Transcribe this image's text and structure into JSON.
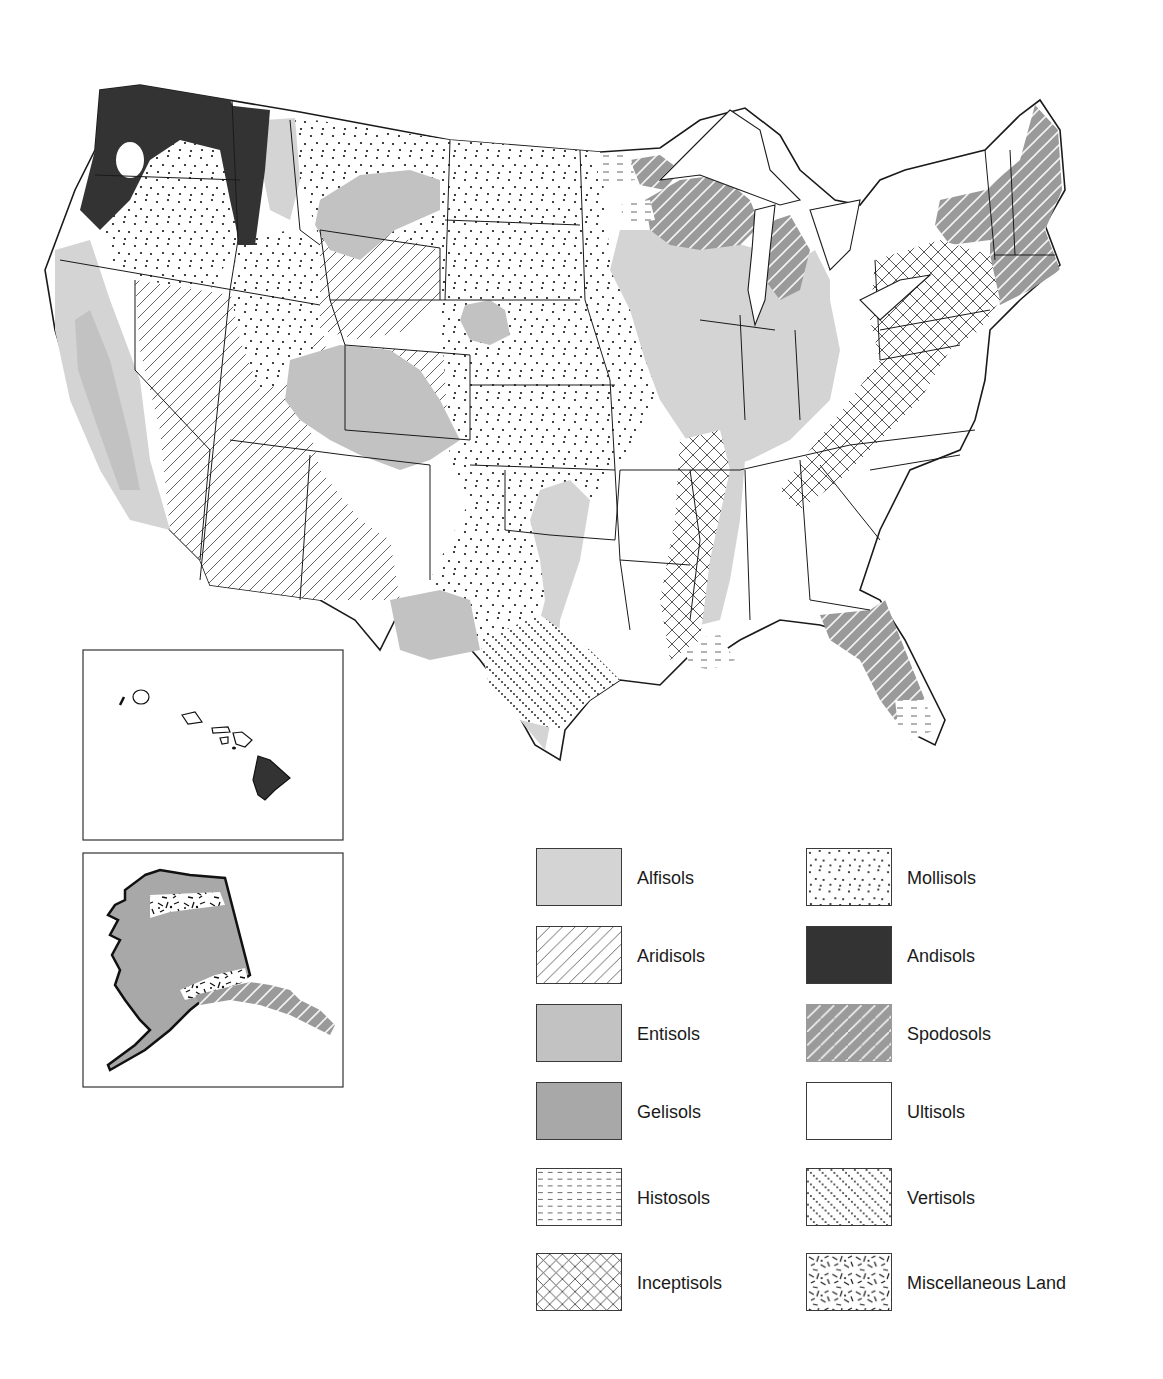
{
  "map": {
    "title": "",
    "regions": {
      "main": "Contiguous United States",
      "inset_1": "Hawaii",
      "inset_2": "Alaska"
    }
  },
  "colors": {
    "alfisols": "#d4d4d4",
    "entisols": "#c2c2c2",
    "gelisols": "#a8a8a8",
    "andisols": "#333333",
    "spodosols": "#9a9a9a",
    "ultisols": "#ffffff",
    "outline": "#1a1a1a"
  },
  "legend": {
    "left": [
      {
        "id": "alfisols",
        "label": "Alfisols",
        "pattern": "solid-light-gray"
      },
      {
        "id": "aridisols",
        "label": "Aridisols",
        "pattern": "diagonal-lines"
      },
      {
        "id": "entisols",
        "label": "Entisols",
        "pattern": "solid-medium-gray"
      },
      {
        "id": "gelisols",
        "label": "Gelisols",
        "pattern": "solid-dark-gray"
      },
      {
        "id": "histosols",
        "label": "Histosols",
        "pattern": "horizontal-dashes"
      },
      {
        "id": "inceptisols",
        "label": "Inceptisols",
        "pattern": "cross-hatch"
      }
    ],
    "right": [
      {
        "id": "mollisols",
        "label": "Mollisols",
        "pattern": "stipple-dots"
      },
      {
        "id": "andisols",
        "label": "Andisols",
        "pattern": "solid-near-black"
      },
      {
        "id": "spodosols",
        "label": "Spodosols",
        "pattern": "gray-with-white-diagonals"
      },
      {
        "id": "ultisols",
        "label": "Ultisols",
        "pattern": "blank-white"
      },
      {
        "id": "vertisols",
        "label": "Vertisols",
        "pattern": "dotted-diagonals"
      },
      {
        "id": "misc",
        "label": "Miscellaneous Land",
        "pattern": "random-slashes"
      }
    ]
  }
}
